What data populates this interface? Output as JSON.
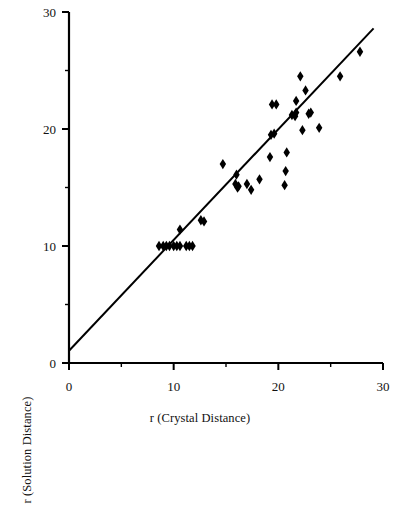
{
  "chart_data": {
    "type": "scatter",
    "title": "",
    "xlabel": "r (Crystal Distance)",
    "ylabel": "r (Solution Distance)",
    "xlim": [
      0,
      30
    ],
    "ylim": [
      0,
      30
    ],
    "xticks": [
      0,
      10,
      20,
      30
    ],
    "xtick_labels": [
      "0",
      "10",
      "20",
      "30"
    ],
    "xminor_ticks": [
      5,
      15,
      25
    ],
    "yticks": [
      0,
      10,
      20,
      30
    ],
    "ytick_labels": [
      "0",
      "10",
      "20",
      "30"
    ],
    "yminor_ticks": [
      5,
      15,
      25
    ],
    "grid": false,
    "legend": null,
    "marker": "diamond",
    "marker_color": "#000000",
    "marker_size": 7,
    "series": [
      {
        "name": "observations",
        "points": [
          [
            8.6,
            10.0
          ],
          [
            9.0,
            10.0
          ],
          [
            9.3,
            10.0
          ],
          [
            9.6,
            10.0
          ],
          [
            10.0,
            10.0
          ],
          [
            10.3,
            10.0
          ],
          [
            10.6,
            10.0
          ],
          [
            11.2,
            10.0
          ],
          [
            11.5,
            10.0
          ],
          [
            11.8,
            10.0
          ],
          [
            10.6,
            11.4
          ],
          [
            12.6,
            12.2
          ],
          [
            12.9,
            12.1
          ],
          [
            14.7,
            17.0
          ],
          [
            15.9,
            15.3
          ],
          [
            16.1,
            15.0
          ],
          [
            16.2,
            15.1
          ],
          [
            16.0,
            16.1
          ],
          [
            17.0,
            15.3
          ],
          [
            17.4,
            14.8
          ],
          [
            18.2,
            15.7
          ],
          [
            19.2,
            17.6
          ],
          [
            19.3,
            19.5
          ],
          [
            19.6,
            19.6
          ],
          [
            19.4,
            22.1
          ],
          [
            19.8,
            22.1
          ],
          [
            20.6,
            15.2
          ],
          [
            20.7,
            16.4
          ],
          [
            20.8,
            18.0
          ],
          [
            21.3,
            21.2
          ],
          [
            21.6,
            21.1
          ],
          [
            21.7,
            21.4
          ],
          [
            21.7,
            22.4
          ],
          [
            22.1,
            24.5
          ],
          [
            22.3,
            19.9
          ],
          [
            22.6,
            23.3
          ],
          [
            22.9,
            21.3
          ],
          [
            23.1,
            21.4
          ],
          [
            23.9,
            20.1
          ],
          [
            25.9,
            24.5
          ],
          [
            27.8,
            26.6
          ]
        ]
      }
    ],
    "fit_line": {
      "name": "regression-line",
      "x0": 0.0,
      "y0": 1.05,
      "x1": 29.1,
      "y1": 28.6,
      "color": "#000000",
      "width": 2
    }
  }
}
